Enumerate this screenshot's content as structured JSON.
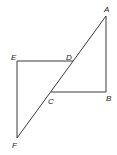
{
  "figure": {
    "points": {
      "A": {
        "label": "A",
        "x": 106,
        "y": 16
      },
      "B": {
        "label": "B",
        "x": 106,
        "y": 92
      },
      "C": {
        "label": "C",
        "x": 51,
        "y": 92
      },
      "D": {
        "label": "D",
        "x": 73,
        "y": 61
      },
      "E": {
        "label": "E",
        "x": 17,
        "y": 61
      },
      "F": {
        "label": "F",
        "x": 17,
        "y": 138
      }
    },
    "segments": [
      "AF",
      "AB",
      "CB",
      "ED",
      "EF"
    ],
    "line_color": "#3a3a3a"
  }
}
